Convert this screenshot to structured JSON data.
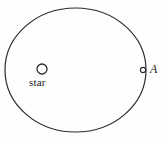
{
  "figure": {
    "background_color": "#fefefe",
    "stroke_color": "#2b2b2b",
    "orbit": {
      "name": "elliptical-orbit",
      "center_x": 75.5,
      "center_y": 70,
      "radius_x": 70.5,
      "radius_y": 62,
      "stroke_width": 1.2,
      "fill": "none"
    },
    "star": {
      "label": "star",
      "marker_x": 42,
      "marker_y": 69,
      "marker_radius": 5,
      "marker_stroke_width": 1.3
    },
    "point_a": {
      "label": "A",
      "marker_x": 143,
      "marker_y": 70,
      "marker_radius": 2.6,
      "marker_stroke_width": 1.1
    }
  }
}
